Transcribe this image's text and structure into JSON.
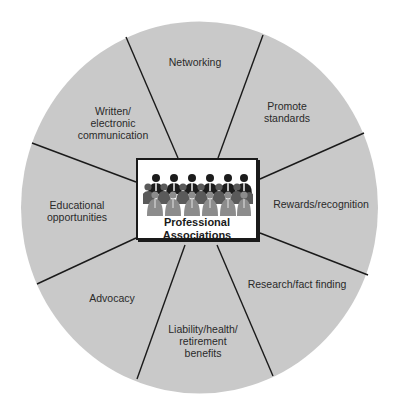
{
  "diagram": {
    "title": "Professional Associations",
    "center": {
      "lines": [
        "Professional",
        "Associations"
      ],
      "icon": "group-of-people-icon"
    },
    "segments": [
      {
        "id": "networking",
        "lines": [
          "Networking"
        ],
        "x": 195,
        "y": 56
      },
      {
        "id": "promote-standards",
        "lines": [
          "Promote",
          "standards"
        ],
        "x": 287,
        "y": 100
      },
      {
        "id": "rewards-recognition",
        "lines": [
          "Rewards/recognition"
        ],
        "x": 321,
        "y": 198
      },
      {
        "id": "research-fact-finding",
        "lines": [
          "Research/fact finding"
        ],
        "x": 297,
        "y": 278
      },
      {
        "id": "liability-health-retirement",
        "lines": [
          "Liability/health/",
          "retirement",
          "benefits"
        ],
        "x": 203,
        "y": 323
      },
      {
        "id": "advocacy",
        "lines": [
          "Advocacy"
        ],
        "x": 112,
        "y": 292
      },
      {
        "id": "educational-opportunities",
        "lines": [
          "Educational",
          "opportunities"
        ],
        "x": 77,
        "y": 199
      },
      {
        "id": "written-electronic-communication",
        "lines": [
          "Written/",
          "electronic",
          "communication"
        ],
        "x": 113,
        "y": 105
      }
    ],
    "colors": {
      "circle_fill": "#c9c9c9",
      "divider": "#1a1a1a",
      "box_fill": "#ffffff",
      "text": "#2a2a2a"
    }
  }
}
